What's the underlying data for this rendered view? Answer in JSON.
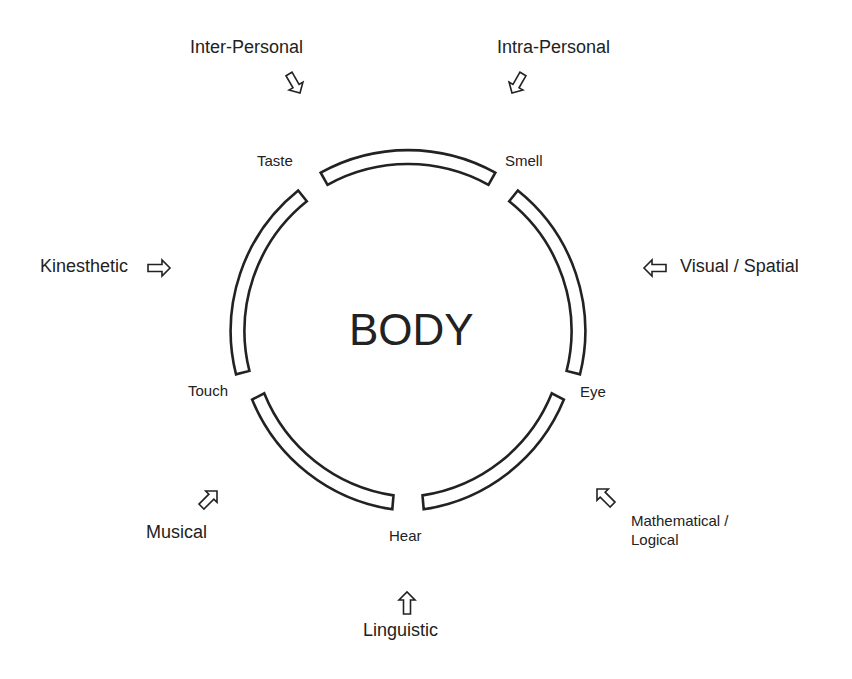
{
  "diagram": {
    "center_label": "BODY",
    "senses": [
      {
        "label": "Taste"
      },
      {
        "label": "Smell"
      },
      {
        "label": "Touch"
      },
      {
        "label": "Eye"
      },
      {
        "label": "Hear"
      }
    ],
    "intelligences": [
      {
        "label": "Inter-Personal"
      },
      {
        "label": "Intra-Personal"
      },
      {
        "label": "Kinesthetic"
      },
      {
        "label": "Visual / Spatial"
      },
      {
        "label": "Musical"
      },
      {
        "label": "Mathematical /",
        "label2": "Logical"
      },
      {
        "label": "Linguistic"
      }
    ],
    "stroke_color": "#222222",
    "fill_color": "#ffffff"
  }
}
